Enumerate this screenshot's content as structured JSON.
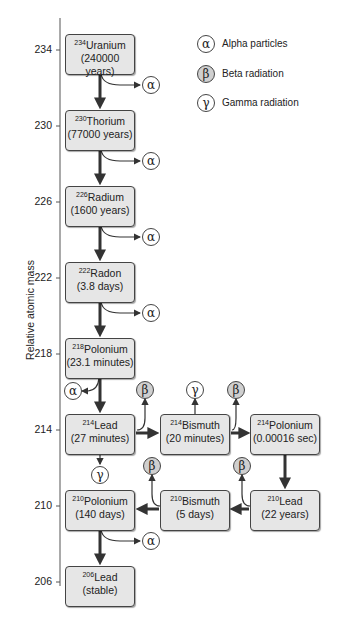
{
  "axis": {
    "label": "Relative atomic mass",
    "ticks": [
      "234",
      "230",
      "226",
      "222",
      "218",
      "214",
      "210",
      "206"
    ]
  },
  "legend": [
    {
      "symbol": "α",
      "label": "Alpha particles",
      "type": "alpha"
    },
    {
      "symbol": "β",
      "label": "Beta radiation",
      "type": "beta"
    },
    {
      "symbol": "γ",
      "label": "Gamma radiation",
      "type": "gamma"
    }
  ],
  "nuclides": [
    {
      "id": "u234",
      "mass": "234",
      "name": "Uranium",
      "halflife": "(240000 years)"
    },
    {
      "id": "th230",
      "mass": "230",
      "name": "Thorium",
      "halflife": "(77000 years)"
    },
    {
      "id": "ra226",
      "mass": "226",
      "name": "Radium",
      "halflife": "(1600 years)"
    },
    {
      "id": "rn222",
      "mass": "222",
      "name": "Radon",
      "halflife": "(3.8 days)"
    },
    {
      "id": "po218",
      "mass": "218",
      "name": "Polonium",
      "halflife": "(23.1 minutes)"
    },
    {
      "id": "pb214",
      "mass": "214",
      "name": "Lead",
      "halflife": "(27 minutes)"
    },
    {
      "id": "bi214",
      "mass": "214",
      "name": "Bismuth",
      "halflife": "(20 minutes)"
    },
    {
      "id": "po214",
      "mass": "214",
      "name": "Polonium",
      "halflife": "(0.00016 sec)"
    },
    {
      "id": "pb210",
      "mass": "210",
      "name": "Lead",
      "halflife": "(22 years)"
    },
    {
      "id": "bi210",
      "mass": "210",
      "name": "Bismuth",
      "halflife": "(5 days)"
    },
    {
      "id": "po210",
      "mass": "210",
      "name": "Polonium",
      "halflife": "(140 days)"
    },
    {
      "id": "pb206",
      "mass": "206",
      "name": "Lead",
      "halflife": "(stable)"
    }
  ],
  "emissions": {
    "alpha": "α",
    "beta": "β",
    "gamma": "γ"
  },
  "colors": {
    "box_fill": "#e6e6e6",
    "beta_fill": "#cfcfcf",
    "line": "#444444"
  }
}
